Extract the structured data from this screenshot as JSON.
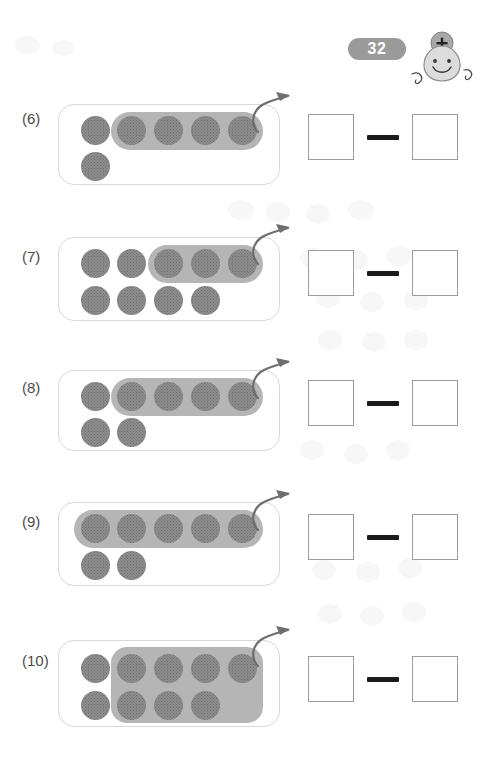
{
  "page": {
    "number": "32",
    "mascot_symbol": "+",
    "badge_color": "#9a9a9a",
    "counter_color": "#8d8d8d",
    "highlight_color": "#b5b5b5",
    "box_border_color": "#d9d9d9",
    "answer_border_color": "#9b9b9b",
    "minus_color": "#1b1b1b"
  },
  "answer": {
    "operator": "minus",
    "left_value": "",
    "right_value": "",
    "left_placeholder": "",
    "right_placeholder": ""
  },
  "problems": [
    {
      "label": "(6)",
      "total_counters": 6,
      "highlighted_counters": 4,
      "remaining_counters": 2,
      "rows": [
        {
          "count": 5,
          "highlighted_indices": [
            1,
            2,
            3,
            4
          ]
        },
        {
          "count": 1,
          "highlighted_indices": []
        }
      ],
      "highlight": {
        "shape": "pill",
        "start_col": 1,
        "end_col": 4,
        "rows_spanned": 1
      },
      "arrow": "curved-up-right-arrow",
      "equation": "6 - 4"
    },
    {
      "label": "(7)",
      "total_counters": 9,
      "highlighted_counters": 3,
      "remaining_counters": 6,
      "rows": [
        {
          "count": 5,
          "highlighted_indices": [
            2,
            3,
            4
          ]
        },
        {
          "count": 4,
          "highlighted_indices": []
        }
      ],
      "highlight": {
        "shape": "pill",
        "start_col": 2,
        "end_col": 4,
        "rows_spanned": 1
      },
      "arrow": "curved-up-right-arrow",
      "equation": "9 - 3"
    },
    {
      "label": "(8)",
      "total_counters": 7,
      "highlighted_counters": 4,
      "remaining_counters": 3,
      "rows": [
        {
          "count": 5,
          "highlighted_indices": [
            1,
            2,
            3,
            4
          ]
        },
        {
          "count": 2,
          "highlighted_indices": []
        }
      ],
      "highlight": {
        "shape": "pill",
        "start_col": 1,
        "end_col": 4,
        "rows_spanned": 1
      },
      "arrow": "curved-up-right-arrow",
      "equation": "7 - 4"
    },
    {
      "label": "(9)",
      "total_counters": 7,
      "highlighted_counters": 5,
      "remaining_counters": 2,
      "rows": [
        {
          "count": 5,
          "highlighted_indices": [
            0,
            1,
            2,
            3,
            4
          ]
        },
        {
          "count": 2,
          "highlighted_indices": []
        }
      ],
      "highlight": {
        "shape": "pill",
        "start_col": 0,
        "end_col": 4,
        "rows_spanned": 1
      },
      "arrow": "curved-up-right-arrow",
      "equation": "7 - 5"
    },
    {
      "label": "(10)",
      "total_counters": 9,
      "highlighted_counters": 7,
      "remaining_counters": 2,
      "rows": [
        {
          "count": 5,
          "highlighted_indices": [
            1,
            2,
            3,
            4
          ]
        },
        {
          "count": 4,
          "highlighted_indices": [
            1,
            2,
            3
          ]
        }
      ],
      "highlight": {
        "shape": "block",
        "start_col": 1,
        "end_col": 4,
        "rows_spanned": 2
      },
      "arrow": "curved-up-right-arrow",
      "equation": "9 - 7"
    }
  ]
}
